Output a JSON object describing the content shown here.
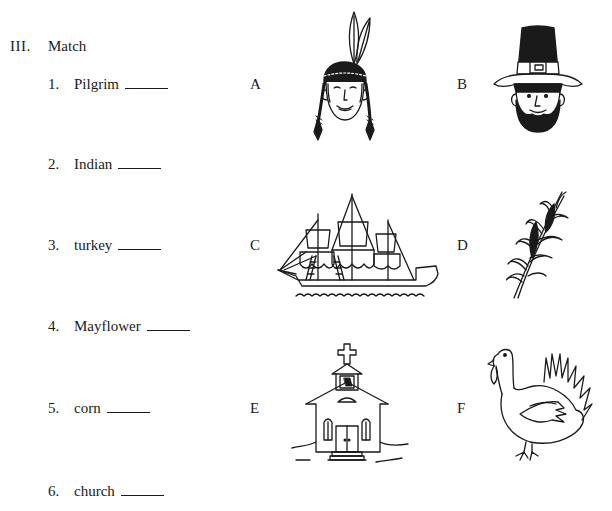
{
  "section": {
    "number": "III.",
    "title": "Match"
  },
  "items": [
    {
      "num": "1.",
      "word": "Pilgrim",
      "answer": ""
    },
    {
      "num": "2.",
      "word": "Indian",
      "answer": ""
    },
    {
      "num": "3.",
      "word": "turkey",
      "answer": ""
    },
    {
      "num": "4.",
      "word": "Mayflower",
      "answer": ""
    },
    {
      "num": "5.",
      "word": "corn",
      "answer": ""
    },
    {
      "num": "6.",
      "word": "church",
      "answer": ""
    }
  ],
  "pictures": [
    {
      "letter": "A",
      "icon": "native-american-head-with-feathers-icon"
    },
    {
      "letter": "B",
      "icon": "pilgrim-head-with-hat-icon"
    },
    {
      "letter": "C",
      "icon": "sailing-ship-icon"
    },
    {
      "letter": "D",
      "icon": "corn-stalk-icon"
    },
    {
      "letter": "E",
      "icon": "church-icon"
    },
    {
      "letter": "F",
      "icon": "turkey-icon"
    }
  ],
  "colors": {
    "ink": "#1a1a1a",
    "paper": "#ffffff"
  }
}
